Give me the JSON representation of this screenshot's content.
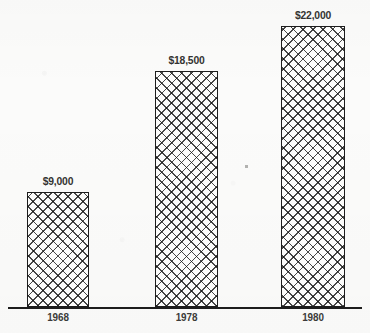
{
  "chart_data": {
    "type": "bar",
    "title": "",
    "subtitle": "",
    "xlabel": "",
    "ylabel": "",
    "categories": [
      "1968",
      "1978",
      "1980"
    ],
    "values": [
      9000,
      18500,
      22000
    ],
    "value_labels": [
      "$9,000",
      "$18,500",
      "$22,000"
    ],
    "series": [
      {
        "name": "",
        "values": [
          9000,
          18500,
          22000
        ]
      }
    ],
    "ylim": [
      0,
      23800
    ],
    "grid": false,
    "legend": false,
    "legend_position": "none",
    "y_axis_visible": false,
    "x_axis_visible": true,
    "bar_fill": "crosshatch",
    "annotations": []
  },
  "style": {
    "background_color": "#fbfbfa",
    "bar_outline_color": "#1d1d1d",
    "bar_fill_color": "#fcfcfb",
    "hatch_color": "#141414",
    "axis_color": "#1d1d1d",
    "value_label_color": "#333331",
    "category_label_color": "#3b3b39"
  },
  "layout": {
    "baseline_y": 307,
    "axis_left": 8,
    "axis_right": 362,
    "bars": [
      {
        "left": 27,
        "width": 62,
        "top": 193,
        "label_top": 176,
        "category_top": 311
      },
      {
        "left": 155,
        "width": 63,
        "top": 71,
        "label_top": 54,
        "category_top": 311
      },
      {
        "left": 281,
        "width": 64,
        "top": 26,
        "label_top": 9,
        "category_top": 311
      }
    ]
  }
}
